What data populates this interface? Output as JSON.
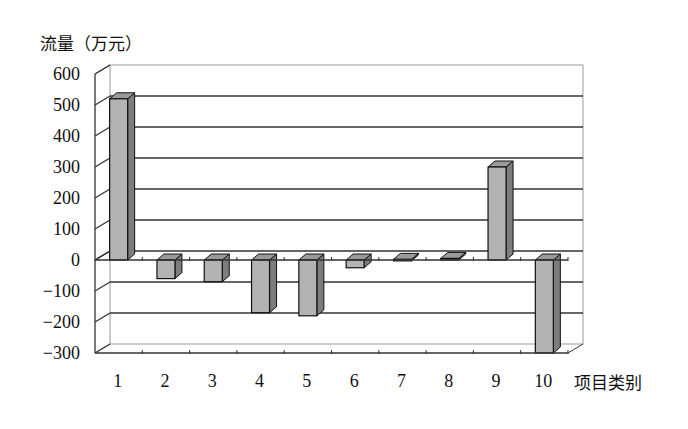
{
  "chart_data": {
    "type": "bar",
    "style": "3d-column",
    "title": "",
    "ylabel": "流量（万元）",
    "xlabel": "项目类别",
    "categories": [
      "1",
      "2",
      "3",
      "4",
      "5",
      "6",
      "7",
      "8",
      "9",
      "10"
    ],
    "values": [
      520,
      -60,
      -70,
      -170,
      -180,
      -25,
      2,
      5,
      300,
      -300
    ],
    "ylim": [
      -300,
      600
    ],
    "yticks": [
      600,
      500,
      400,
      300,
      200,
      100,
      0,
      -100,
      -200,
      -300
    ],
    "ytick_labels": [
      "600",
      "500",
      "400",
      "300",
      "200",
      "100",
      "0",
      "−100",
      "−200",
      "−300"
    ],
    "grid": true,
    "legend": "none",
    "colors": {
      "bar_front": "#b3b3b3",
      "bar_side": "#7d7d7d",
      "bar_top": "#9a9a9a",
      "grid": "#333333",
      "wall": "#999999"
    }
  }
}
